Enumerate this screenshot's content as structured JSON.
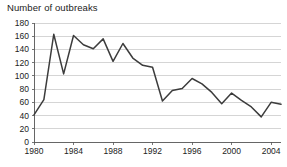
{
  "chart_data": {
    "type": "line",
    "title": "Number of outbreaks",
    "xlabel": "",
    "ylabel": "",
    "ylim": [
      0,
      180
    ],
    "xlim": [
      1980,
      2005
    ],
    "ytick_step": 20,
    "xtick_step": 4,
    "grid": "horizontal",
    "legend": "none",
    "line_color": "#3c3c3c",
    "grid_color": "#b9b9b9",
    "axis_color": "#555555",
    "yticks": [
      0,
      20,
      40,
      60,
      80,
      100,
      120,
      140,
      160,
      180
    ],
    "xticks": [
      1980,
      1984,
      1988,
      1992,
      1996,
      2000,
      2004
    ],
    "x": [
      1980,
      1981,
      1982,
      1983,
      1984,
      1985,
      1986,
      1987,
      1988,
      1989,
      1990,
      1991,
      1992,
      1993,
      1994,
      1995,
      1996,
      1997,
      1998,
      1999,
      2000,
      2001,
      2002,
      2003,
      2004,
      2005
    ],
    "values": [
      41,
      64,
      163,
      103,
      161,
      147,
      141,
      156,
      122,
      149,
      127,
      116,
      113,
      62,
      78,
      81,
      96,
      88,
      75,
      58,
      74,
      63,
      53,
      38,
      60,
      57
    ],
    "series": [
      {
        "name": "Number of outbreaks",
        "values": [
          41,
          64,
          163,
          103,
          161,
          147,
          141,
          156,
          122,
          149,
          127,
          116,
          113,
          62,
          78,
          81,
          96,
          88,
          75,
          58,
          74,
          63,
          53,
          38,
          60,
          57
        ]
      }
    ]
  },
  "geometry": {
    "plot_left": 34,
    "plot_right": 281,
    "plot_top": 23,
    "plot_bottom": 142
  }
}
